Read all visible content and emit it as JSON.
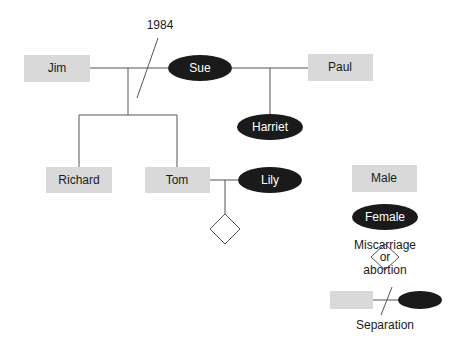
{
  "diagram": {
    "type": "genogram",
    "annotation_year": "1984",
    "people": {
      "jim": {
        "label": "Jim",
        "sex": "male"
      },
      "sue": {
        "label": "Sue",
        "sex": "female"
      },
      "paul": {
        "label": "Paul",
        "sex": "male"
      },
      "harriet": {
        "label": "Harriet",
        "sex": "female"
      },
      "richard": {
        "label": "Richard",
        "sex": "male"
      },
      "tom": {
        "label": "Tom",
        "sex": "male"
      },
      "lily": {
        "label": "Lily",
        "sex": "female"
      }
    },
    "relationships": [
      {
        "partners": [
          "Jim",
          "Sue"
        ],
        "status": "separated",
        "year": "1984",
        "children": [
          "Richard",
          "Tom"
        ]
      },
      {
        "partners": [
          "Sue",
          "Paul"
        ],
        "children": [
          "Harriet"
        ]
      },
      {
        "partners": [
          "Tom",
          "Lily"
        ],
        "children": [
          "miscarriage or abortion"
        ]
      }
    ],
    "legend": {
      "male": "Male",
      "female": "Female",
      "miscarriage_line1": "Miscarriage",
      "miscarriage_line2": "or",
      "miscarriage_line3": "abortion",
      "separation": "Separation"
    },
    "colors": {
      "male_fill": "#d9d9d9",
      "female_fill": "#1a1a1a",
      "line": "#555555"
    }
  }
}
